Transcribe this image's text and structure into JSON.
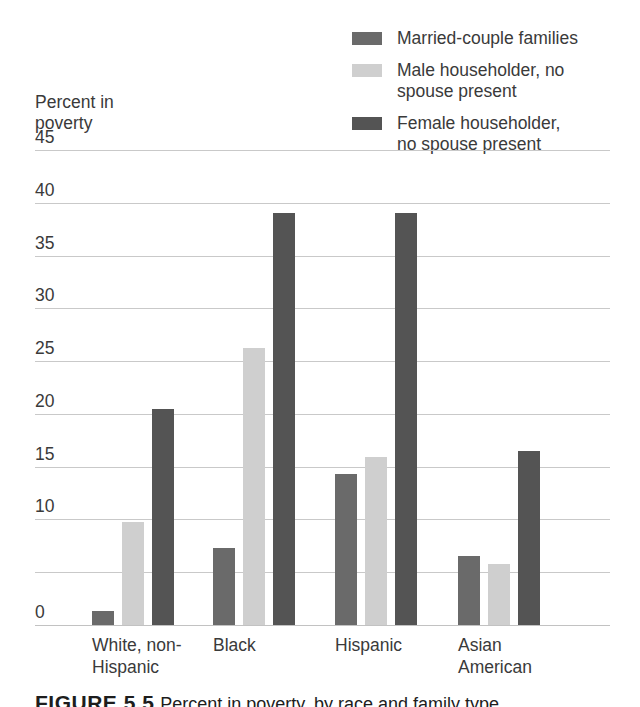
{
  "chart_data": {
    "type": "bar",
    "title": "",
    "xlabel": "",
    "ylabel": "Percent in\npoverty",
    "ylim": [
      0,
      45
    ],
    "yticks": [
      45,
      40,
      35,
      30,
      25,
      20,
      15,
      10,
      0
    ],
    "ytick_labels": [
      "45",
      "40",
      "35",
      "30",
      "25",
      "20",
      "15",
      "10",
      "0"
    ],
    "gridlines": [
      45,
      40,
      35,
      30,
      25,
      20,
      15,
      10,
      5,
      0
    ],
    "grid": true,
    "legend_position": "top-right",
    "categories": [
      "White, non-\nHispanic",
      "Black",
      "Hispanic",
      "Asian\nAmerican"
    ],
    "series": [
      {
        "name": "Married-couple families",
        "color": "#6a6a6a",
        "values": [
          1.3,
          7.3,
          14.3,
          6.5
        ]
      },
      {
        "name": "Male householder, no\nspouse present",
        "color": "#cfcfcf",
        "values": [
          9.8,
          26.2,
          15.9,
          5.8
        ]
      },
      {
        "name": "Female householder,\nno spouse present",
        "color": "#545454",
        "values": [
          20.5,
          39.0,
          39.0,
          16.5
        ]
      }
    ]
  },
  "axis_title": "Percent in\npoverty",
  "legend": {
    "items": [
      {
        "label": "Married-couple families",
        "color": "#6a6a6a"
      },
      {
        "label": "Male householder, no\nspouse present",
        "color": "#cfcfcf"
      },
      {
        "label": "Female householder,\nno spouse present",
        "color": "#545454"
      }
    ]
  },
  "caption": {
    "figure_label": "FIGURE 5.5",
    "text": "Percent in poverty, by race and family type"
  }
}
